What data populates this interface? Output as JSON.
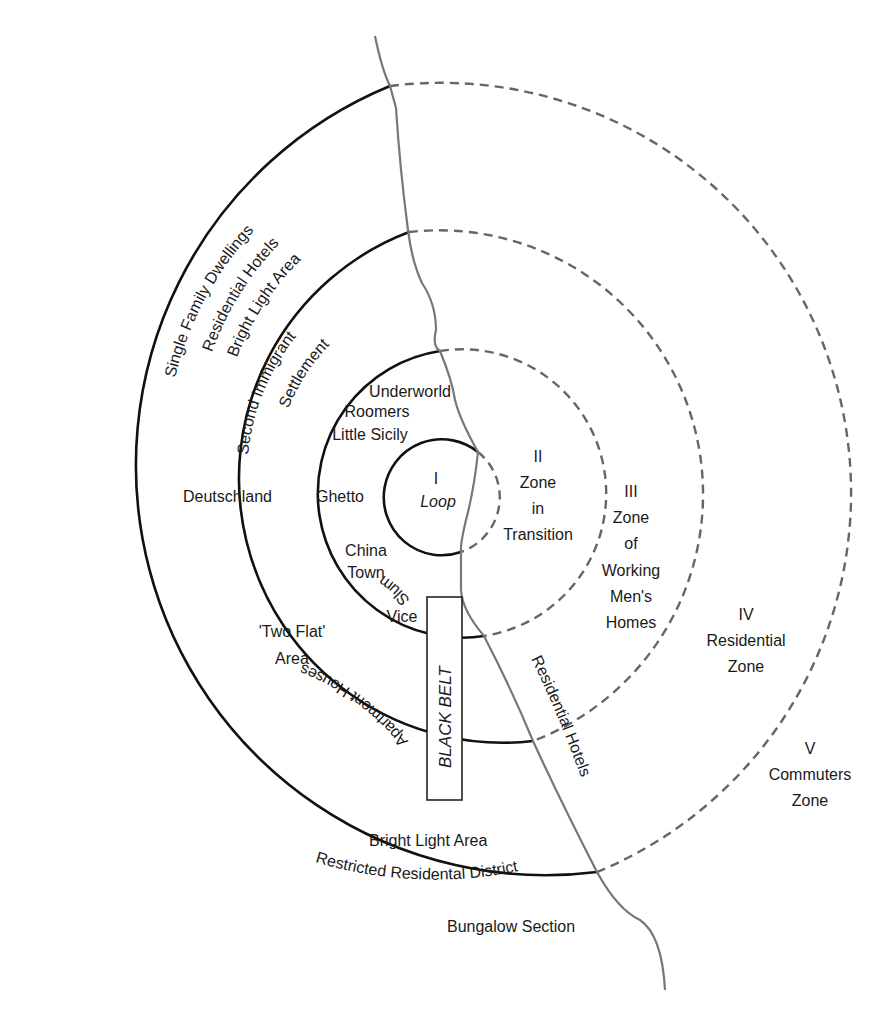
{
  "diagram": {
    "type": "concentric zone model",
    "colors": {
      "solid_ring": "#111111",
      "dashed_ring": "#666666",
      "river": "#777777",
      "text": "#1a1a1a",
      "background": "#ffffff"
    },
    "zones": [
      {
        "numeral": "I",
        "name": "Loop"
      },
      {
        "numeral": "II",
        "name_lines": [
          "Zone",
          "in",
          "Transition"
        ]
      },
      {
        "numeral": "III",
        "name_lines": [
          "Zone",
          "of",
          "Working",
          "Men's",
          "Homes"
        ]
      },
      {
        "numeral": "IV",
        "name_lines": [
          "Residential",
          "Zone"
        ]
      },
      {
        "numeral": "V",
        "name_lines": [
          "Commuters",
          "Zone"
        ]
      }
    ],
    "outer_arc_labels": [
      "Single Family Dwellings",
      "Residential Hotels",
      "Bright Light Area"
    ],
    "second_immigrant": [
      "Second Immigrant",
      "Settlement"
    ],
    "zone2_left_labels": [
      "Underworld",
      "Roomers",
      "Little Sicily"
    ],
    "ghetto": "Ghetto",
    "deutschland": "Deutschland",
    "slum": "Slum",
    "china_town": [
      "China",
      "Town"
    ],
    "vice": "Vice",
    "two_flat": [
      "'Two Flat'",
      "Area"
    ],
    "apartment_houses": "Apartment Houses",
    "black_belt": "BLACK BELT",
    "bright_light_bottom": "Bright Light Area",
    "restricted_district": "Restricted Residental District",
    "bungalow_section": "Bungalow Section",
    "residential_hotels_river": "Residential Hotels"
  }
}
